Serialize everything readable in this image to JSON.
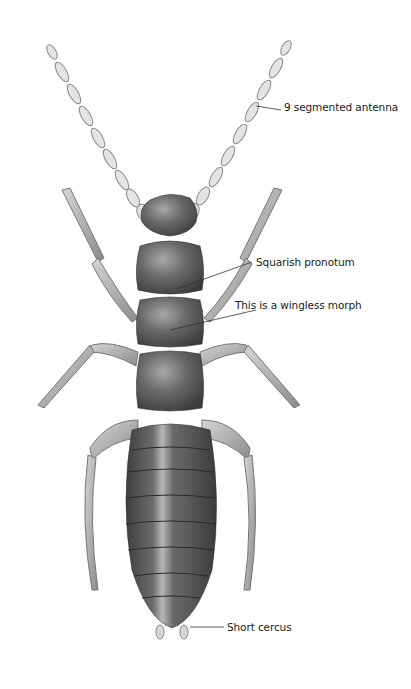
{
  "figure": {
    "colors": {
      "background": "#ffffff",
      "body_dark": "#4a4a4a",
      "body_mid": "#7a7a7a",
      "highlight": "#d8d8d8",
      "appendage": "#c8c8c8",
      "leader_line": "#333333",
      "label_text": "#1a1a1a"
    },
    "labels": [
      {
        "id": "antenna",
        "text": "9 segmented antenna",
        "x": 284,
        "y": 107
      },
      {
        "id": "pronotum",
        "text": "Squarish pronotum",
        "x": 256,
        "y": 256
      },
      {
        "id": "wingless",
        "text": "This is a wingless morph",
        "x": 235,
        "y": 299
      },
      {
        "id": "cercus",
        "text": "Short cercus",
        "x": 227,
        "y": 627
      }
    ]
  }
}
